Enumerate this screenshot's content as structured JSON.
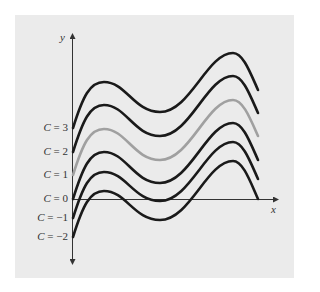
{
  "chart_data": {
    "type": "line",
    "title": "",
    "xlabel": "x",
    "ylabel": "y",
    "grid": false,
    "legend": "inline labels on y-axis",
    "series": [
      {
        "name": "C = 3",
        "C": 3,
        "color": "#1a1a1a",
        "points": [
          [
            73,
            128
          ],
          [
            104,
            82
          ],
          [
            160,
            112
          ],
          [
            233,
            53
          ],
          [
            258,
            90
          ]
        ]
      },
      {
        "name": "C = 2",
        "C": 2,
        "color": "#1a1a1a",
        "points": [
          [
            73,
            152
          ],
          [
            104,
            105
          ],
          [
            160,
            136
          ],
          [
            233,
            76
          ],
          [
            258,
            113
          ]
        ]
      },
      {
        "name": "C = 1",
        "C": 1,
        "color": "#a0a0a0",
        "points": [
          [
            73,
            175
          ],
          [
            104,
            129
          ],
          [
            160,
            160
          ],
          [
            233,
            100
          ],
          [
            258,
            136
          ]
        ]
      },
      {
        "name": "C = 0",
        "C": 0,
        "color": "#1a1a1a",
        "points": [
          [
            73,
            199
          ],
          [
            104,
            152
          ],
          [
            160,
            183
          ],
          [
            233,
            123
          ],
          [
            258,
            160
          ]
        ]
      },
      {
        "name": "C = -1",
        "C": -1,
        "color": "#1a1a1a",
        "points": [
          [
            73,
            218
          ],
          [
            104,
            172
          ],
          [
            160,
            201
          ],
          [
            233,
            142
          ],
          [
            258,
            179
          ]
        ]
      },
      {
        "name": "C = -2",
        "C": -2,
        "color": "#1a1a1a",
        "points": [
          [
            73,
            237
          ],
          [
            104,
            191
          ],
          [
            160,
            220
          ],
          [
            233,
            161
          ],
          [
            258,
            199
          ]
        ]
      }
    ],
    "labels": [
      {
        "text": "C = 3",
        "y": 128
      },
      {
        "text": "C = 2",
        "y": 152
      },
      {
        "text": "C = 1",
        "y": 175
      },
      {
        "text": "C = 0",
        "y": 199
      },
      {
        "text": "C = −1",
        "y": 218
      },
      {
        "text": "C = −2",
        "y": 237
      }
    ]
  },
  "axes": {
    "x_label": "x",
    "y_label": "y"
  },
  "colors": {
    "panel": "#ebebeb",
    "curve": "#1a1a1a",
    "highlight": "#a0a0a0",
    "axis": "#333333"
  }
}
